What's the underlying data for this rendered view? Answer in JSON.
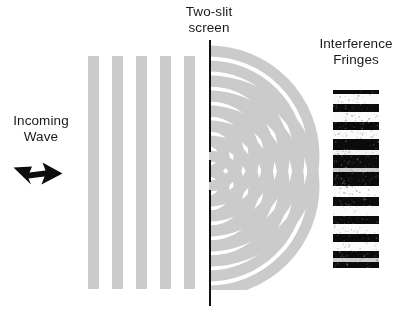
{
  "figure": {
    "background_color": "#ffffff"
  },
  "labels": {
    "two_slit_screen": "Two-slit\nscreen",
    "interference_fringes": "Interference\nFringes",
    "incoming_wave": "Incoming\nWave"
  },
  "colors": {
    "wavefront_gray": "#cbcbcb",
    "wavefront_overlap_dark": "#7c7c7c",
    "barrier_black": "#111111",
    "arrow_black": "#0d0d0d",
    "fringe_dark": "#0b0b0b",
    "fringe_bright": "#fbfbfb",
    "text": "#1a1a1a"
  },
  "incoming_wave": {
    "icon": "right-arrow-icon",
    "direction": "right",
    "bar_count": 5,
    "bars": [
      {
        "x": 88,
        "y": 56,
        "width": 11,
        "height": 233
      },
      {
        "x": 112,
        "y": 56,
        "width": 11,
        "height": 233
      },
      {
        "x": 136,
        "y": 56,
        "width": 11,
        "height": 233
      },
      {
        "x": 160,
        "y": 56,
        "width": 11,
        "height": 233
      },
      {
        "x": 184,
        "y": 56,
        "width": 11,
        "height": 233
      }
    ]
  },
  "barrier": {
    "x": 209,
    "top": 40,
    "bottom": 306,
    "slits": [
      {
        "center_y": 156,
        "gap": 7
      },
      {
        "center_y": 186,
        "gap": 7
      }
    ],
    "segments": [
      {
        "top": 40,
        "height": 112
      },
      {
        "top": 160,
        "height": 22
      },
      {
        "top": 190,
        "height": 116
      }
    ]
  },
  "diffraction": {
    "description": "Two sets of concentric circular wavefronts radiating from the two slits; overlapping lobes render darker.",
    "sources": [
      {
        "id": "slit-upper",
        "cx": 209,
        "cy": 156
      },
      {
        "id": "slit-lower",
        "cx": 209,
        "cy": 186
      }
    ],
    "ring_band_width": 11,
    "ring_radii": [
      15,
      30,
      45,
      60,
      75,
      90,
      105
    ],
    "ring_count": 7
  },
  "fringes": {
    "box": {
      "x": 333,
      "y": 90,
      "width": 46,
      "height": 178
    },
    "band_count": 10,
    "bands": [
      {
        "y": 4,
        "height": 10,
        "tone": "bright"
      },
      {
        "y": 22,
        "height": 10,
        "tone": "bright"
      },
      {
        "y": 40,
        "height": 9,
        "tone": "bright"
      },
      {
        "y": 60,
        "height": 5,
        "tone": "soft"
      },
      {
        "y": 78,
        "height": 4,
        "tone": "dim"
      },
      {
        "y": 96,
        "height": 11,
        "tone": "bright"
      },
      {
        "y": 116,
        "height": 10,
        "tone": "bright"
      },
      {
        "y": 134,
        "height": 10,
        "tone": "bright"
      },
      {
        "y": 152,
        "height": 9,
        "tone": "bright"
      },
      {
        "y": 168,
        "height": 4,
        "tone": "dim"
      }
    ]
  }
}
